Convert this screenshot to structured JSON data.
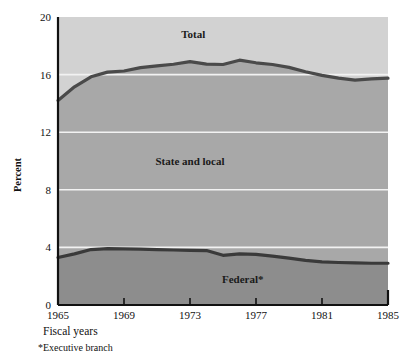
{
  "chart_data": {
    "type": "area",
    "title": "",
    "xlabel": "Fiscal years",
    "ylabel": "Percent",
    "footnote": "*Executive branch",
    "x": [
      1965,
      1966,
      1967,
      1968,
      1969,
      1970,
      1971,
      1972,
      1973,
      1974,
      1975,
      1976,
      1977,
      1978,
      1979,
      1980,
      1981,
      1982,
      1983,
      1984,
      1985
    ],
    "xlim": [
      1965,
      1985
    ],
    "ylim": [
      0,
      20
    ],
    "xticks": [
      1965,
      1969,
      1973,
      1977,
      1981,
      1985
    ],
    "xtick_labels": [
      "1965",
      "1969",
      "1973",
      "1977",
      "1981",
      "1985"
    ],
    "yticks": [
      0,
      4,
      8,
      12,
      16,
      20
    ],
    "ytick_labels": [
      "0",
      "4",
      "8",
      "12",
      "16",
      "20"
    ],
    "grid": "horizontal-white",
    "legend": "inline-annotations",
    "series": [
      {
        "name": "Federal*",
        "label": "Federal*",
        "fill_color": "#8d8d8d",
        "line_color": "#3a3a3a",
        "label_x": 1976.2,
        "label_y": 1.55,
        "values": [
          3.3,
          3.55,
          3.85,
          3.92,
          3.9,
          3.88,
          3.85,
          3.82,
          3.8,
          3.78,
          3.45,
          3.55,
          3.52,
          3.4,
          3.25,
          3.1,
          3.0,
          2.95,
          2.92,
          2.9,
          2.9
        ]
      },
      {
        "name": "State and local",
        "label": "State and local",
        "fill_color": "#a8a8a8",
        "line_color": "#3a3a3a",
        "label_x": 1973.0,
        "label_y": 9.7,
        "values": [
          10.9,
          11.6,
          12.0,
          12.25,
          12.35,
          12.6,
          12.75,
          12.9,
          13.1,
          12.95,
          13.25,
          13.45,
          13.3,
          13.3,
          13.25,
          13.1,
          12.95,
          12.8,
          12.7,
          12.8,
          12.85
        ]
      },
      {
        "name": "Total",
        "label": "Total",
        "fill_color": "#d2d2d2",
        "line_color": "#4a4a4a",
        "label_x": 1973.2,
        "label_y": 18.55,
        "values": [
          14.2,
          15.15,
          15.85,
          16.17,
          16.25,
          16.48,
          16.6,
          16.72,
          16.9,
          16.73,
          16.7,
          17.0,
          16.82,
          16.7,
          16.5,
          16.2,
          15.95,
          15.75,
          15.62,
          15.7,
          15.75
        ]
      }
    ]
  },
  "axis": {
    "y_title": "Percent",
    "x_caption": "Fiscal years",
    "footnote": "*Executive branch"
  }
}
